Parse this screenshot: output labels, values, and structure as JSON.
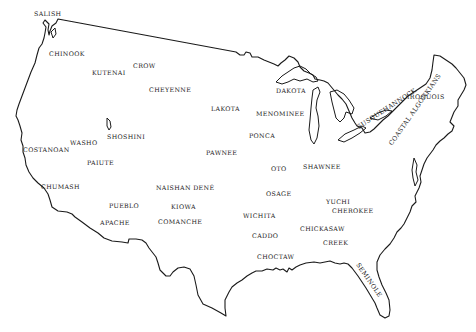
{
  "map": {
    "subject": "Native American tribes of the contiguous United States",
    "outline_color": "#1a1a1a",
    "label_color": "#222222",
    "background": "#ffffff",
    "tribes": [
      {
        "name": "SALISH",
        "x": 34,
        "y": 11,
        "rotate": 0
      },
      {
        "name": "CHINOOK",
        "x": 49,
        "y": 51,
        "rotate": 0
      },
      {
        "name": "KUTENAI",
        "x": 92,
        "y": 70,
        "rotate": 0
      },
      {
        "name": "CROW",
        "x": 133,
        "y": 63,
        "rotate": 0
      },
      {
        "name": "CHEYENNE",
        "x": 149,
        "y": 87,
        "rotate": 0
      },
      {
        "name": "DAKOTA",
        "x": 276,
        "y": 88,
        "rotate": 0
      },
      {
        "name": "LAKOTA",
        "x": 211,
        "y": 106,
        "rotate": 0
      },
      {
        "name": "MENOMINEE",
        "x": 256,
        "y": 111,
        "rotate": 0
      },
      {
        "name": "IROQUOIS",
        "x": 407,
        "y": 94,
        "rotate": 0
      },
      {
        "name": "SUSQUEHANNOCK",
        "x": 356,
        "y": 125,
        "rotate": -33
      },
      {
        "name": "COASTAL ALGONKIANS",
        "x": 388,
        "y": 143,
        "rotate": -55
      },
      {
        "name": "WASHO",
        "x": 70,
        "y": 140,
        "rotate": 0
      },
      {
        "name": "SHOSHINI",
        "x": 107,
        "y": 134,
        "rotate": 0
      },
      {
        "name": "COSTANOAN",
        "x": 23,
        "y": 147,
        "rotate": 0
      },
      {
        "name": "PAIUTE",
        "x": 87,
        "y": 160,
        "rotate": 0
      },
      {
        "name": "PONCA",
        "x": 249,
        "y": 133,
        "rotate": 0
      },
      {
        "name": "PAWNEE",
        "x": 206,
        "y": 150,
        "rotate": 0
      },
      {
        "name": "OTO",
        "x": 271,
        "y": 166,
        "rotate": 0
      },
      {
        "name": "SHAWNEE",
        "x": 303,
        "y": 164,
        "rotate": 0
      },
      {
        "name": "CHUMASH",
        "x": 41,
        "y": 184,
        "rotate": 0
      },
      {
        "name": "NAISHAN DENÉ",
        "x": 156,
        "y": 185,
        "rotate": 0
      },
      {
        "name": "OSAGE",
        "x": 266,
        "y": 191,
        "rotate": 0
      },
      {
        "name": "YUCHI",
        "x": 326,
        "y": 199,
        "rotate": 0
      },
      {
        "name": "CHEROKEE",
        "x": 332,
        "y": 208,
        "rotate": 0
      },
      {
        "name": "PUEBLO",
        "x": 109,
        "y": 203,
        "rotate": 0
      },
      {
        "name": "KIOWA",
        "x": 171,
        "y": 204,
        "rotate": 0
      },
      {
        "name": "WICHITA",
        "x": 243,
        "y": 213,
        "rotate": 0
      },
      {
        "name": "APACHE",
        "x": 100,
        "y": 220,
        "rotate": 0
      },
      {
        "name": "COMANCHE",
        "x": 158,
        "y": 219,
        "rotate": 0
      },
      {
        "name": "CHICKASAW",
        "x": 300,
        "y": 226,
        "rotate": 0
      },
      {
        "name": "CADDO",
        "x": 252,
        "y": 233,
        "rotate": 0
      },
      {
        "name": "CREEK",
        "x": 323,
        "y": 240,
        "rotate": 0
      },
      {
        "name": "CHOCTAW",
        "x": 257,
        "y": 254,
        "rotate": 0
      },
      {
        "name": "SEMINOLE",
        "x": 360,
        "y": 262,
        "rotate": 55
      }
    ]
  }
}
